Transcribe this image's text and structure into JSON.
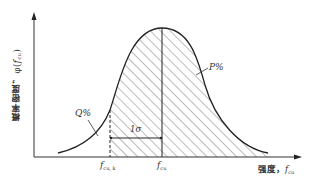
{
  "diagram": {
    "title": "",
    "type": "normal-distribution-curve",
    "y_axis": {
      "label_text": "概率密度，",
      "label_symbol": "φ(",
      "label_var": "f",
      "label_sub": "cu",
      "label_close": ")"
    },
    "x_axis": {
      "label_text": "强度，",
      "label_var": "f",
      "label_sub": "cu"
    },
    "markers": {
      "characteristic": {
        "var": "f",
        "sub": "cu, k"
      },
      "mean": {
        "var": "f",
        "sub": "cu"
      }
    },
    "annotations": {
      "q_percent": "Q%",
      "p_percent": "P%",
      "sigma": "1σ"
    },
    "colors": {
      "line": "#222222",
      "hatch": "#555555",
      "text": "#333333",
      "background": "#ffffff"
    }
  }
}
